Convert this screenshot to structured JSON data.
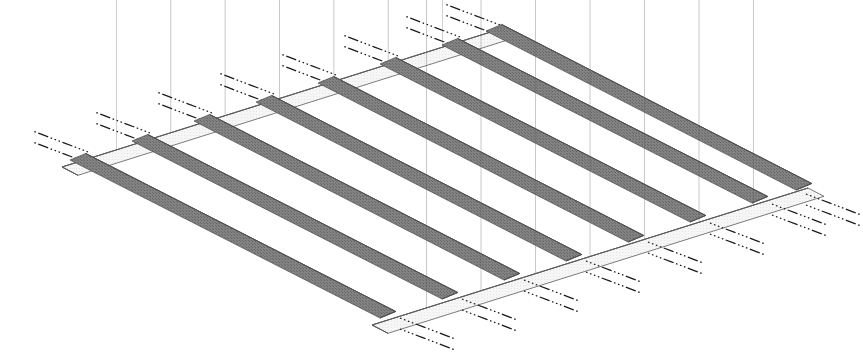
{
  "figure": {
    "background_color": "#ffffff",
    "width": 863,
    "height": 361
  },
  "palette": {
    "joist_fill": "#6f6f6f",
    "joist_fill_light": "#7b7b7b",
    "joist_edge": "#4a4a4a",
    "rim_top_face": "#f2f2f2",
    "rim_front_face": "#e8e8e8",
    "rim_end_face": "#d8d8d8",
    "outline": "#5a5a5a",
    "leader_color": "#1a1a1a",
    "hatch_color": "#555555"
  },
  "projection": {
    "type": "isometric",
    "joist_direction_deg": 27.5,
    "rim_direction_deg": -22.5,
    "beam_depth_px": 30,
    "note": "joists run lower-left to upper-right; rim beams run upper-left to lower-right"
  },
  "geometry": {
    "top_rim": {
      "start": [
        62,
        167
      ],
      "end": [
        497,
        30
      ],
      "label": "upper rim beam"
    },
    "bottom_rim": {
      "start": [
        372,
        325
      ],
      "end": [
        808,
        188
      ],
      "label": "lower rim beam"
    },
    "joist_count": 8,
    "joist_span_px": 340,
    "joist_width_px": 17,
    "joist_pitch_px": 52
  },
  "joists": [
    {
      "id": "J1",
      "label": "joist-1",
      "start": [
        70,
        160
      ],
      "end": [
        380,
        318
      ]
    },
    {
      "id": "J2",
      "label": "joist-2",
      "start": [
        132,
        141
      ],
      "end": [
        442,
        299
      ]
    },
    {
      "id": "J3",
      "label": "joist-3",
      "start": [
        194,
        121
      ],
      "end": [
        504,
        280
      ]
    },
    {
      "id": "J4",
      "label": "joist-4",
      "start": [
        256,
        102
      ],
      "end": [
        566,
        261
      ]
    },
    {
      "id": "J5",
      "label": "joist-5",
      "start": [
        318,
        83
      ],
      "end": [
        628,
        242
      ]
    },
    {
      "id": "J6",
      "label": "joist-6",
      "start": [
        380,
        64
      ],
      "end": [
        690,
        222
      ]
    },
    {
      "id": "J7",
      "label": "joist-7",
      "start": [
        442,
        45
      ],
      "end": [
        752,
        203
      ]
    },
    {
      "id": "J8",
      "label": "joist-8",
      "start": [
        486,
        31
      ],
      "end": [
        796,
        190
      ]
    }
  ],
  "rim_beams": [
    {
      "id": "R-top",
      "label": "upper-rim-beam",
      "face": "light",
      "segments": 8
    },
    {
      "id": "R-bottom",
      "label": "lower-rim-beam",
      "face": "light",
      "segments": 8
    }
  ],
  "leaders": {
    "style": "dash-dot",
    "description": "paired dash-dot leader lines pointing to each joist/rim connection",
    "pair_offset_px": 11,
    "length_px": 60,
    "top_edge": [
      {
        "target": [
          88,
          152
        ],
        "dir": [
          -1,
          -0.38
        ]
      },
      {
        "target": [
          150,
          133
        ],
        "dir": [
          -1,
          -0.38
        ]
      },
      {
        "target": [
          212,
          113
        ],
        "dir": [
          -1,
          -0.38
        ]
      },
      {
        "target": [
          274,
          94
        ],
        "dir": [
          -1,
          -0.38
        ]
      },
      {
        "target": [
          336,
          75
        ],
        "dir": [
          -1,
          -0.38
        ]
      },
      {
        "target": [
          398,
          56
        ],
        "dir": [
          -1,
          -0.38
        ]
      },
      {
        "target": [
          460,
          37
        ],
        "dir": [
          -1,
          -0.38
        ]
      },
      {
        "target": [
          500,
          25
        ],
        "dir": [
          -1,
          -0.38
        ]
      }
    ],
    "bottom_edge": [
      {
        "target": [
          400,
          318
        ],
        "dir": [
          1,
          0.38
        ]
      },
      {
        "target": [
          462,
          299
        ],
        "dir": [
          1,
          0.38
        ]
      },
      {
        "target": [
          524,
          280
        ],
        "dir": [
          1,
          0.38
        ]
      },
      {
        "target": [
          586,
          261
        ],
        "dir": [
          1,
          0.38
        ]
      },
      {
        "target": [
          648,
          242
        ],
        "dir": [
          1,
          0.38
        ]
      },
      {
        "target": [
          710,
          223
        ],
        "dir": [
          1,
          0.38
        ]
      },
      {
        "target": [
          772,
          204
        ],
        "dir": [
          1,
          0.38
        ]
      },
      {
        "target": [
          806,
          194
        ],
        "dir": [
          1,
          0.38
        ]
      }
    ]
  },
  "annotations": {
    "visible_text": [],
    "note": "diagram contains no visible text labels"
  }
}
